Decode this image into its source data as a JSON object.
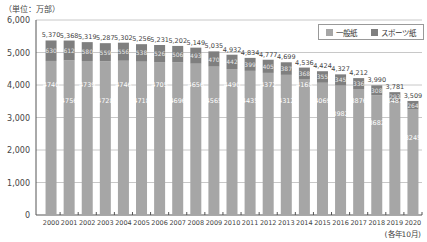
{
  "header": {
    "unit_label": "（単位：万部）",
    "period_label": "(各年10月)"
  },
  "legend": {
    "items": [
      {
        "label": "一般紙",
        "color": "#a6a6a6"
      },
      {
        "label": "スポーツ紙",
        "color": "#7f7f7f"
      }
    ]
  },
  "chart_data": {
    "type": "bar",
    "stacked": true,
    "title": "",
    "xlabel": "(各年10月)",
    "ylabel": "（単位：万部）",
    "ylim": [
      0,
      6000
    ],
    "yticks": [
      0,
      1000,
      2000,
      3000,
      4000,
      5000,
      6000
    ],
    "ytick_labels": [
      "0",
      "1,000",
      "2,000",
      "3,000",
      "4,000",
      "5,000",
      "6,000"
    ],
    "grid": true,
    "legend_position": "top-right",
    "categories": [
      "2000",
      "2001",
      "2002",
      "2003",
      "2004",
      "2005",
      "2006",
      "2007",
      "2008",
      "2009",
      "2010",
      "2011",
      "2012",
      "2013",
      "2014",
      "2015",
      "2016",
      "2017",
      "2018",
      "2019",
      "2020"
    ],
    "series": [
      {
        "name": "一般紙",
        "color": "#a6a6a6",
        "values": [
          4740,
          4756,
          4739,
          4728,
          4746,
          4718,
          4705,
          4696,
          4656,
          4565,
          4490,
          4435,
          4372,
          4312,
          4168,
          4069,
          3982,
          3876,
          3682,
          3487,
          3245
        ]
      },
      {
        "name": "スポーツ紙",
        "color": "#7f7f7f",
        "values": [
          630,
          612,
          580,
          559,
          556,
          538,
          526,
          506,
          493,
          470,
          442,
          399,
          405,
          387,
          368,
          355,
          345,
          336,
          308,
          293,
          264
        ]
      }
    ],
    "totals": [
      5370,
      5368,
      5319,
      5287,
      5302,
      5256,
      5231,
      5202,
      5149,
      5035,
      4932,
      4834,
      4777,
      4699,
      4536,
      4424,
      4327,
      4212,
      3990,
      3781,
      3509
    ],
    "total_labels": [
      "5,370",
      "5,368",
      "5,319",
      "5,287",
      "5,302",
      "5,256",
      "5,231",
      "5,202",
      "5,149",
      "5,035",
      "4,932",
      "4,834",
      "4,777",
      "4,699",
      "4,536",
      "4,424",
      "4,327",
      "4,212",
      "3,990",
      "3,781",
      "3,509"
    ]
  }
}
